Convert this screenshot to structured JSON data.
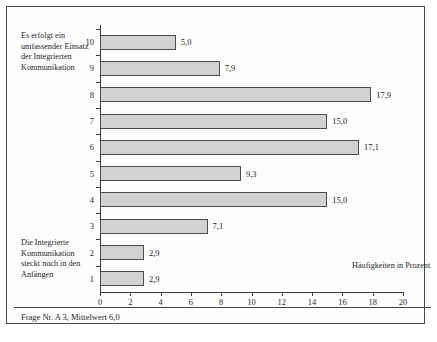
{
  "figure": {
    "footnote": "Frage Nr. A 3, Mittelwert 6,0",
    "anchor_top": "Es erfolgt ein umfassender Einsatz der Integrierten Kommunikation",
    "anchor_bottom": "Die Integrierte Kommunikation steckt noch in den Anfängen",
    "legend": "Häufigkeiten in Prozent",
    "bar_fill": "#d2d2d2",
    "bar_stroke": "#4d4d4d",
    "axis_color": "#3a3a3a"
  },
  "chart_data": {
    "type": "bar",
    "orientation": "horizontal",
    "title": "",
    "subtitle": "",
    "xlabel": "Häufigkeiten in Prozent",
    "ylabel": "",
    "categories": [
      "1",
      "2",
      "3",
      "4",
      "5",
      "6",
      "7",
      "8",
      "9",
      "10"
    ],
    "values": [
      2.9,
      2.9,
      7.1,
      15.0,
      9.3,
      17.1,
      15.0,
      17.9,
      7.9,
      5.0
    ],
    "value_labels": [
      "2,9",
      "2,9",
      "7,1",
      "15,0",
      "9,3",
      "17,1",
      "15,0",
      "17,9",
      "7,9",
      "5,0"
    ],
    "xlim": [
      0,
      20
    ],
    "xticks": [
      0,
      2,
      4,
      6,
      8,
      10,
      12,
      14,
      16,
      18,
      20
    ],
    "xtick_labels": [
      "0",
      "2",
      "4",
      "6",
      "8",
      "10",
      "12",
      "14",
      "16",
      "18",
      "20"
    ],
    "grid": false,
    "legend_position": "inside-bottom-right",
    "annotations": [
      "Es erfolgt ein umfassender Einsatz der Integrierten Kommunikation",
      "Die Integrierte Kommunikation steckt noch in den Anfängen",
      "Frage Nr. A 3, Mittelwert 6,0"
    ],
    "mean": 6.0
  }
}
